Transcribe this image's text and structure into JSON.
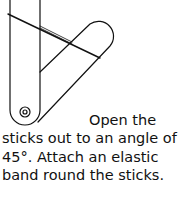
{
  "illustration": {
    "description": "Two sticks hinged at the bottom, opened to 45 degrees with an elastic band around them",
    "stroke_color": "#111111"
  },
  "caption": {
    "line1": "Open the",
    "line2": "sticks out to an angle of",
    "line3": "45°. Attach an elastic",
    "line4": "band round the sticks."
  }
}
